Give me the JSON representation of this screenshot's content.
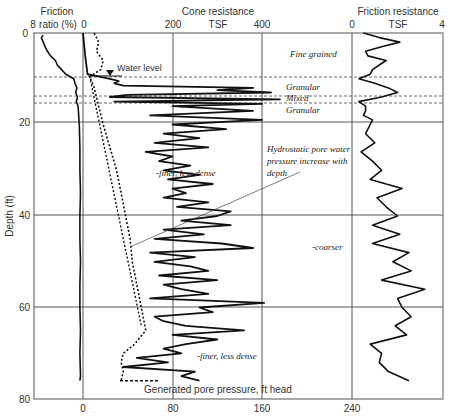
{
  "chart_data": {
    "type": "line",
    "ylabel": "Depth (ft)",
    "ylim": [
      0,
      80
    ],
    "y_ticks": [
      0,
      20,
      40,
      60,
      80
    ],
    "panels": [
      {
        "name": "Friction ratio",
        "header_line1": "Friction",
        "header_line2": "ratio (%)",
        "axis_left_tick": "8",
        "axis_right_tick": "0",
        "xlim": [
          8,
          0
        ]
      },
      {
        "name": "Cone resistance",
        "header_line1": "Cone resistance",
        "header_line2": "TSF",
        "ticks_top": [
          "0",
          "200",
          "400"
        ],
        "xlim": [
          0,
          400
        ]
      },
      {
        "name": "Friction resistance",
        "header_line1": "Friction resistance",
        "header_line2": "TSF",
        "ticks_top": [
          "0",
          "4"
        ],
        "xlim": [
          0,
          4
        ]
      }
    ],
    "bottom_axis": {
      "label": "Generated pore pressure, ft head",
      "ticks": [
        "0",
        "80",
        "160",
        "240"
      ],
      "xlim": [
        0,
        240
      ]
    },
    "layers": [
      {
        "label": "Fine grained",
        "depth_top": 0,
        "depth_bottom": 9.5
      },
      {
        "label": "Granular",
        "depth_top": 9.5,
        "depth_bottom": 13.5
      },
      {
        "label": "Mixed",
        "depth_top": 13.5,
        "depth_bottom": 15.5
      },
      {
        "label": "Granular",
        "depth_top": 15.5,
        "depth_bottom": 20
      }
    ],
    "layer_boundaries_depth": [
      9.5,
      13.5,
      15.5
    ],
    "annotations": [
      {
        "text": "Water level",
        "depth": 9
      },
      {
        "text": "-finer, less dense",
        "depth": 30
      },
      {
        "text": "Hydrostatic pore water",
        "depth": 25
      },
      {
        "text": "pressure increase with",
        "depth": 27.5
      },
      {
        "text": "depth",
        "depth": 30
      },
      {
        "text": "-coarser",
        "depth": 47
      },
      {
        "text": "-finer, less dense",
        "depth": 71
      }
    ],
    "series": [
      {
        "name": "Friction ratio (%)",
        "depth": [
          0.5,
          1,
          2,
          3,
          4,
          5,
          6,
          7,
          8,
          9,
          10,
          11,
          12,
          13,
          14,
          15,
          16,
          18,
          20,
          25,
          30,
          35,
          40,
          45,
          50,
          55,
          60,
          65,
          70,
          75,
          76
        ],
        "values": [
          6.5,
          6.8,
          6.5,
          6.2,
          5.8,
          5.3,
          4.5,
          4.2,
          3.5,
          2.8,
          1.5,
          1.3,
          1.0,
          1.2,
          0.9,
          1.1,
          0.8,
          0.7,
          0.6,
          0.5,
          0.5,
          0.4,
          0.5,
          0.5,
          0.4,
          0.5,
          0.5,
          0.4,
          0.5,
          0.4,
          0.5
        ]
      },
      {
        "name": "Cone resistance (TSF)",
        "depth": [
          0,
          5,
          9,
          10,
          10.5,
          11,
          11.5,
          12,
          12.5,
          13,
          13.5,
          14,
          14.5,
          15,
          15.5,
          16,
          17,
          18,
          19,
          20,
          21,
          22,
          23,
          24,
          25,
          26,
          27,
          28,
          29,
          30,
          31,
          32,
          33,
          34,
          35,
          36,
          37,
          38,
          39,
          40,
          41,
          42,
          43,
          44,
          45,
          46,
          47,
          48,
          49,
          50,
          51,
          52,
          53,
          54,
          55,
          56,
          57,
          58,
          59,
          60,
          61,
          62,
          63,
          64,
          65,
          66,
          67,
          68,
          69,
          70,
          71,
          72,
          73,
          74,
          75,
          76
        ],
        "values": [
          0,
          5,
          10,
          60,
          80,
          70,
          90,
          380,
          300,
          420,
          100,
          60,
          440,
          70,
          400,
          200,
          380,
          150,
          400,
          200,
          320,
          180,
          260,
          160,
          280,
          140,
          200,
          170,
          240,
          180,
          260,
          190,
          290,
          200,
          230,
          180,
          280,
          210,
          330,
          300,
          220,
          330,
          180,
          270,
          160,
          310,
          380,
          150,
          250,
          160,
          240,
          280,
          170,
          300,
          180,
          220,
          280,
          150,
          405,
          260,
          290,
          160,
          180,
          230,
          360,
          200,
          300,
          230,
          180,
          220,
          120,
          190,
          90,
          250,
          220,
          260
        ]
      },
      {
        "name": "Friction resistance (TSF)",
        "depth": [
          0,
          1,
          2,
          3,
          4,
          5,
          6,
          7,
          8,
          9,
          10,
          11,
          12,
          13,
          14,
          15,
          16,
          17,
          18,
          19,
          20,
          22,
          24,
          26,
          28,
          30,
          32,
          34,
          36,
          38,
          40,
          42,
          44,
          46,
          48,
          50,
          52,
          54,
          56,
          58,
          60,
          62,
          64,
          66,
          68,
          70,
          72,
          74,
          76
        ],
        "values": [
          0.5,
          1.2,
          2.1,
          1.3,
          0.6,
          0.7,
          1.5,
          1.2,
          0.9,
          0.8,
          0.3,
          1.0,
          1.6,
          2.0,
          1.3,
          0.3,
          0.6,
          0.6,
          0.5,
          0.9,
          0.8,
          0.6,
          1.0,
          0.4,
          0.9,
          1.3,
          0.8,
          2.2,
          1.1,
          1.5,
          2.0,
          0.9,
          2.1,
          0.9,
          2.5,
          1.8,
          2.6,
          1.3,
          3.2,
          2.0,
          2.2,
          2.6,
          1.9,
          2.4,
          0.8,
          1.3,
          1.2,
          1.6,
          2.5
        ]
      },
      {
        "name": "Generated pore pressure (ft head)",
        "style": "dotted",
        "depth": [
          0,
          2,
          4,
          6,
          8,
          9.5,
          12,
          16,
          20,
          25,
          30,
          35,
          40,
          45,
          50,
          55,
          60,
          65,
          68,
          70,
          72,
          74,
          76
        ],
        "values": [
          10,
          14,
          12,
          18,
          16,
          6,
          10,
          14,
          18,
          24,
          30,
          34,
          38,
          42,
          44,
          48,
          52,
          56,
          46,
          36,
          34,
          36,
          34
        ]
      },
      {
        "name": "Hydrostatic line",
        "style": "dotted-straight",
        "depth": [
          9.5,
          64
        ],
        "values": [
          6,
          52
        ]
      }
    ]
  }
}
